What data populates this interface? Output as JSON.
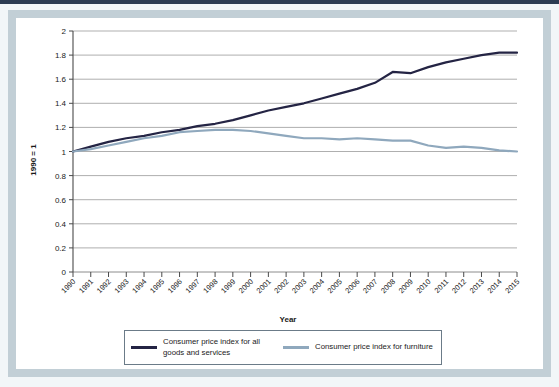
{
  "figure": {
    "frame_color": "#c2cfd6",
    "background": "#ffffff",
    "top_band_color": "#2c3c52"
  },
  "legend": {
    "position": "below-axis",
    "entries": [
      {
        "label": "Consumer price index for all goods and services",
        "color": "#242444",
        "swatch": "line-swatch-dark"
      },
      {
        "label": "Consumer price index for furniture",
        "color": "#8fa8bd",
        "swatch": "line-swatch-light"
      }
    ]
  },
  "chart_data": {
    "type": "line",
    "title": "",
    "subtitle": "",
    "xlabel": "Year",
    "ylabel": "1990 = 1",
    "xlim": [
      1990,
      2015
    ],
    "ylim": [
      0,
      2
    ],
    "ytick_step": 0.2,
    "grid": "horizontal",
    "legend_position": "bottom",
    "x": [
      1990,
      1991,
      1992,
      1993,
      1994,
      1995,
      1996,
      1997,
      1998,
      1999,
      2000,
      2001,
      2002,
      2003,
      2004,
      2005,
      2006,
      2007,
      2008,
      2009,
      2010,
      2011,
      2012,
      2013,
      2014,
      2015
    ],
    "xtick_labels": [
      "1990",
      "1991",
      "1992",
      "1993",
      "1994",
      "1995",
      "1996",
      "1997",
      "1998",
      "1999",
      "2000",
      "2001",
      "2002",
      "2003",
      "2004",
      "2005",
      "2006",
      "2007",
      "2008",
      "2009",
      "2010",
      "2011",
      "2012",
      "2013",
      "2014",
      "2015"
    ],
    "ytick_labels": [
      "0",
      "0.2",
      "0.4",
      "0.6",
      "0.8",
      "1",
      "1.2",
      "1.4",
      "1.6",
      "1.8",
      "2"
    ],
    "ytick_values": [
      0,
      0.2,
      0.4,
      0.6,
      0.8,
      1,
      1.2,
      1.4,
      1.6,
      1.8,
      2
    ],
    "series": [
      {
        "name": "Consumer price index for all goods and services",
        "color": "#242444",
        "width": 2.2,
        "values": [
          1.0,
          1.04,
          1.08,
          1.11,
          1.13,
          1.16,
          1.18,
          1.21,
          1.23,
          1.26,
          1.3,
          1.34,
          1.37,
          1.4,
          1.44,
          1.48,
          1.52,
          1.57,
          1.66,
          1.65,
          1.7,
          1.74,
          1.77,
          1.8,
          1.82,
          1.82
        ]
      },
      {
        "name": "Consumer price index for furniture",
        "color": "#8fa8bd",
        "width": 2.2,
        "values": [
          1.0,
          1.02,
          1.05,
          1.08,
          1.11,
          1.13,
          1.16,
          1.17,
          1.18,
          1.18,
          1.17,
          1.15,
          1.13,
          1.11,
          1.11,
          1.1,
          1.11,
          1.1,
          1.09,
          1.09,
          1.05,
          1.03,
          1.04,
          1.03,
          1.01,
          1.0
        ]
      }
    ]
  }
}
